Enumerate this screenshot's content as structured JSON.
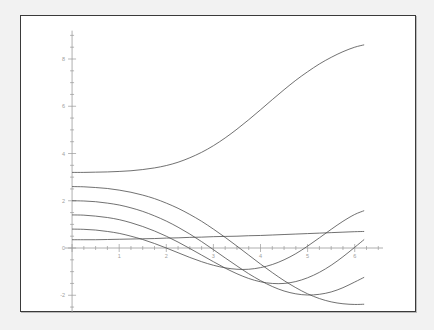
{
  "figure": {
    "title": "",
    "background": "#f2f2f2",
    "panel_background": "#ffffff",
    "frame_color": "#3a3a3a",
    "curve_color": "#4d4d4d",
    "axis_color": "#9a9a9a"
  },
  "chart_data": {
    "type": "line",
    "title": "",
    "xlabel": "",
    "ylabel": "",
    "xlim": [
      -0.15,
      6.6
    ],
    "ylim": [
      -3.1,
      9.2
    ],
    "grid": false,
    "legend": null,
    "legend_position": "none",
    "xticks": [
      0,
      1,
      2,
      3,
      4,
      5,
      6
    ],
    "xticklabels": [
      "0",
      "1",
      "2",
      "3",
      "4",
      "5",
      "6"
    ],
    "yticks": [
      -2,
      0,
      2,
      4,
      6,
      8
    ],
    "yticklabels": [
      "-2",
      "0",
      "2",
      "4",
      "6",
      "8"
    ],
    "x": [
      0,
      0.25,
      0.5,
      0.75,
      1,
      1.25,
      1.5,
      1.75,
      2,
      2.25,
      2.5,
      2.75,
      3,
      3.25,
      3.5,
      3.75,
      4,
      4.25,
      4.5,
      4.75,
      5,
      5.25,
      5.5,
      5.75,
      6,
      6.2
    ],
    "series": [
      {
        "name": "c = 3.20",
        "initial_value": 3.2,
        "values": [
          3.2,
          3.2,
          3.21,
          3.22,
          3.24,
          3.27,
          3.32,
          3.39,
          3.49,
          3.63,
          3.82,
          4.05,
          4.33,
          4.66,
          5.03,
          5.43,
          5.85,
          6.28,
          6.7,
          7.1,
          7.46,
          7.79,
          8.07,
          8.31,
          8.5,
          8.6
        ]
      },
      {
        "name": "c = 2.60",
        "initial_value": 2.6,
        "values": [
          2.6,
          2.59,
          2.56,
          2.52,
          2.45,
          2.36,
          2.24,
          2.09,
          1.9,
          1.68,
          1.42,
          1.13,
          0.8,
          0.45,
          0.08,
          -0.3,
          -0.68,
          -1.04,
          -1.38,
          -1.68,
          -1.94,
          -2.14,
          -2.28,
          -2.36,
          -2.39,
          -2.38
        ]
      },
      {
        "name": "c = 2.00",
        "initial_value": 2.0,
        "values": [
          2.0,
          1.99,
          1.96,
          1.9,
          1.82,
          1.7,
          1.55,
          1.36,
          1.14,
          0.88,
          0.59,
          0.27,
          -0.07,
          -0.42,
          -0.76,
          -1.09,
          -1.38,
          -1.63,
          -1.82,
          -1.94,
          -1.99,
          -1.96,
          -1.86,
          -1.68,
          -1.44,
          -1.24
        ]
      },
      {
        "name": "c = 1.40",
        "initial_value": 1.4,
        "values": [
          1.4,
          1.39,
          1.35,
          1.29,
          1.2,
          1.07,
          0.91,
          0.72,
          0.5,
          0.25,
          -0.02,
          -0.3,
          -0.58,
          -0.85,
          -1.09,
          -1.29,
          -1.43,
          -1.5,
          -1.5,
          -1.42,
          -1.26,
          -1.03,
          -0.73,
          -0.37,
          0.03,
          0.36
        ]
      },
      {
        "name": "c = 0.80",
        "initial_value": 0.8,
        "values": [
          0.8,
          0.79,
          0.76,
          0.7,
          0.62,
          0.5,
          0.36,
          0.19,
          0.0,
          -0.2,
          -0.4,
          -0.58,
          -0.73,
          -0.84,
          -0.9,
          -0.9,
          -0.83,
          -0.7,
          -0.5,
          -0.24,
          0.08,
          0.43,
          0.79,
          1.13,
          1.42,
          1.58
        ]
      },
      {
        "name": "c = 0.35",
        "initial_value": 0.35,
        "values": [
          0.35,
          0.35,
          0.35,
          0.36,
          0.37,
          0.38,
          0.39,
          0.4,
          0.42,
          0.43,
          0.45,
          0.46,
          0.48,
          0.49,
          0.5,
          0.52,
          0.53,
          0.55,
          0.57,
          0.59,
          0.61,
          0.63,
          0.65,
          0.67,
          0.69,
          0.7
        ]
      }
    ]
  }
}
